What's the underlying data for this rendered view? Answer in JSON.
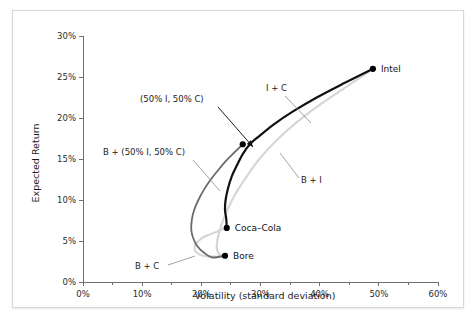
{
  "chart_data": {
    "type": "line",
    "title": "",
    "xlabel": "Volatility (standard deviation)",
    "ylabel": "Expected Return",
    "xlim": [
      0,
      60
    ],
    "ylim": [
      0,
      30
    ],
    "grid": false,
    "legend": "none",
    "xticks": [
      "0%",
      "10%",
      "20%",
      "30%",
      "40%",
      "50%",
      "60%"
    ],
    "xtick_values": [
      0,
      10,
      20,
      30,
      40,
      50,
      60
    ],
    "xminor_values": [
      5,
      15,
      25,
      35,
      45,
      55
    ],
    "yticks": [
      "0%",
      "5%",
      "10%",
      "15%",
      "20%",
      "25%",
      "30%"
    ],
    "ytick_values": [
      0,
      5,
      10,
      15,
      20,
      25,
      30
    ],
    "series": [
      {
        "name": "I + C",
        "color": "#111111",
        "width": 2.2,
        "points": [
          [
            49.0,
            26.0
          ],
          [
            44.0,
            24.2
          ],
          [
            39.5,
            22.5
          ],
          [
            35.5,
            20.8
          ],
          [
            32.2,
            19.2
          ],
          [
            29.8,
            17.8
          ],
          [
            28.2,
            16.8
          ],
          [
            27.0,
            15.6
          ],
          [
            26.0,
            14.2
          ],
          [
            25.1,
            12.8
          ],
          [
            24.5,
            11.4
          ],
          [
            24.1,
            10.0
          ],
          [
            24.0,
            8.8
          ],
          [
            24.2,
            7.8
          ],
          [
            24.3,
            6.6
          ]
        ]
      },
      {
        "name": "B + (50% I, 50% C)",
        "color": "#6b6b6b",
        "width": 1.8,
        "points": [
          [
            27.0,
            16.8
          ],
          [
            25.6,
            15.8
          ],
          [
            24.2,
            14.8
          ],
          [
            22.8,
            13.6
          ],
          [
            21.5,
            12.4
          ],
          [
            20.4,
            11.2
          ],
          [
            19.5,
            10.0
          ],
          [
            18.8,
            8.8
          ],
          [
            18.4,
            7.6
          ],
          [
            18.3,
            6.4
          ],
          [
            18.6,
            5.4
          ],
          [
            19.3,
            4.4
          ],
          [
            20.4,
            3.6
          ],
          [
            21.8,
            3.0
          ],
          [
            24.0,
            3.2
          ]
        ]
      },
      {
        "name": "B + I",
        "color": "#d6d6d6",
        "width": 2.2,
        "points": [
          [
            49.0,
            26.0
          ],
          [
            44.5,
            23.8
          ],
          [
            40.0,
            21.6
          ],
          [
            36.0,
            19.4
          ],
          [
            32.6,
            17.2
          ],
          [
            29.8,
            15.0
          ],
          [
            27.6,
            12.8
          ],
          [
            25.8,
            10.8
          ],
          [
            24.4,
            8.8
          ],
          [
            23.4,
            7.0
          ],
          [
            22.8,
            5.4
          ],
          [
            22.6,
            4.2
          ],
          [
            22.9,
            3.5
          ],
          [
            23.5,
            3.2
          ],
          [
            24.0,
            3.2
          ]
        ]
      },
      {
        "name": "B + C",
        "color": "#d6d6d6",
        "width": 2.2,
        "points": [
          [
            24.3,
            6.6
          ],
          [
            22.8,
            6.2
          ],
          [
            21.4,
            5.8
          ],
          [
            20.2,
            5.4
          ],
          [
            19.4,
            4.9
          ],
          [
            18.9,
            4.4
          ],
          [
            18.9,
            3.9
          ],
          [
            19.4,
            3.5
          ],
          [
            20.3,
            3.2
          ],
          [
            21.6,
            3.1
          ],
          [
            23.0,
            3.1
          ],
          [
            24.0,
            3.2
          ]
        ]
      }
    ],
    "points": [
      {
        "label": "Intel",
        "x": 49.0,
        "y": 26.0,
        "label_dx": 8,
        "label_dy": 3.2
      },
      {
        "label": "Coca–Cola",
        "x": 24.3,
        "y": 6.6,
        "label_dx": 8,
        "label_dy": 3.2
      },
      {
        "label": "Bore",
        "x": 24.0,
        "y": 3.2,
        "label_dx": 8,
        "label_dy": 3.2
      },
      {
        "label": "",
        "x": 27.0,
        "y": 16.8,
        "label_dx": 0,
        "label_dy": 0
      }
    ],
    "annotations": [
      {
        "name": "fifty-fifty",
        "text": "(50% I, 50% C)",
        "text_x": 127,
        "text_y": 91,
        "leader": "M 205 96 L 240 136",
        "arrow": true
      },
      {
        "name": "i-plus-c",
        "text": "I + C",
        "text_x": 253,
        "text_y": 80,
        "leader": "M 272 85 L 298 112",
        "arrow": false
      },
      {
        "name": "b-plus-fifty-fifty",
        "text": "B + (50% I, 50% C)",
        "text_x": 90,
        "text_y": 144,
        "leader": "M 180 149 L 207 180",
        "arrow": false
      },
      {
        "name": "b-plus-i",
        "text": "B + I",
        "text_x": 288,
        "text_y": 172,
        "leader": "M 286 167 L 267 142",
        "arrow": false
      },
      {
        "name": "b-plus-c",
        "text": "B + C",
        "text_x": 122,
        "text_y": 258,
        "leader": "M 155 254 L 182 245",
        "arrow": false
      }
    ]
  }
}
